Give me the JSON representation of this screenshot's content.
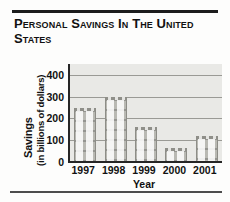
{
  "title": "Personal Savings in the United States",
  "chart_data": {
    "type": "bar",
    "title": "Personal Savings in the United States",
    "xlabel": "Year",
    "ylabel": "Savings",
    "ylabel_sub": "(in billions of dollars)",
    "categories": [
      "1997",
      "1998",
      "1999",
      "2000",
      "2001"
    ],
    "values": [
      250,
      300,
      160,
      65,
      120
    ],
    "ylim": [
      0,
      450
    ],
    "yticks": [
      0,
      100,
      200,
      300,
      400
    ],
    "ytick_labels": [
      "0",
      "100",
      "200",
      "300",
      "400"
    ],
    "grid": true,
    "legend": "none",
    "colors": {
      "plot_background": "#e9e9e6",
      "bar_fill": "#b9b9b3",
      "gridline": "#9a9a95",
      "axis": "#262626",
      "text": "#111111"
    }
  }
}
